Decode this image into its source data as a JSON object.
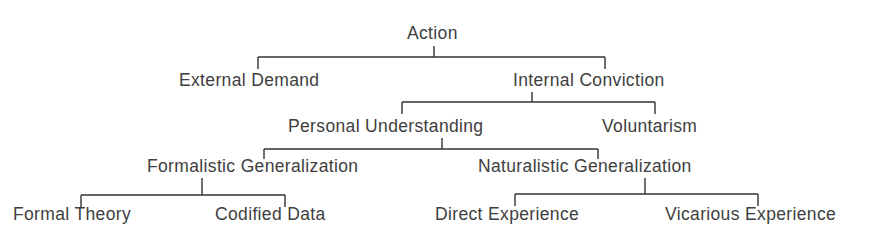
{
  "diagram": {
    "type": "tree",
    "title": "Action",
    "nodes": [
      {
        "id": "action",
        "label": "Action",
        "x": 407,
        "y": 27
      },
      {
        "id": "external_demand",
        "label": "External Demand",
        "x": 179,
        "y": 74
      },
      {
        "id": "internal_conviction",
        "label": "Internal Conviction",
        "x": 513,
        "y": 74
      },
      {
        "id": "personal_understanding",
        "label": "Personal Understanding",
        "x": 288,
        "y": 120
      },
      {
        "id": "voluntarism",
        "label": "Voluntarism",
        "x": 602,
        "y": 120
      },
      {
        "id": "formalistic_generalization",
        "label": "Formalistic Generalization",
        "x": 147,
        "y": 160
      },
      {
        "id": "naturalistic_generalization",
        "label": "Naturalistic Generalization",
        "x": 478,
        "y": 160
      },
      {
        "id": "formal_theory",
        "label": "Formal Theory",
        "x": 13,
        "y": 208
      },
      {
        "id": "codified_data",
        "label": "Codified Data",
        "x": 215,
        "y": 208
      },
      {
        "id": "direct_experience",
        "label": "Direct Experience",
        "x": 435,
        "y": 208
      },
      {
        "id": "vicarious_experience",
        "label": "Vicarious Experience",
        "x": 665,
        "y": 208
      }
    ],
    "edges": [
      {
        "parent": "action",
        "children": [
          "external_demand",
          "internal_conviction"
        ]
      },
      {
        "parent": "internal_conviction",
        "children": [
          "personal_understanding",
          "voluntarism"
        ]
      },
      {
        "parent": "personal_understanding",
        "children": [
          "formalistic_generalization",
          "naturalistic_generalization"
        ]
      },
      {
        "parent": "formalistic_generalization",
        "children": [
          "formal_theory",
          "codified_data"
        ]
      },
      {
        "parent": "naturalistic_generalization",
        "children": [
          "direct_experience",
          "vicarious_experience"
        ]
      }
    ],
    "line_color": "#333333",
    "text_color": "#3e3e3e"
  }
}
